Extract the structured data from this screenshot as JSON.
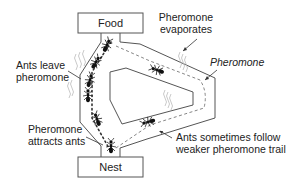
{
  "diagram": {
    "type": "ant-colony-pheromone-trail",
    "nodes": {
      "food": {
        "label": "Food"
      },
      "nest": {
        "label": "Nest"
      }
    },
    "annotations": {
      "ants_leave": [
        "Ants leave",
        "pheromone"
      ],
      "evaporates": [
        "Pheromone",
        "evaporates"
      ],
      "pheromone": "Pheromone",
      "attracts": [
        "Pheromone",
        "attracts ants"
      ],
      "sometimes": [
        "Ants sometimes follow",
        "weaker pheromone trail"
      ]
    },
    "colors": {
      "line": "#555555",
      "ant": "#111111",
      "trail_strong": "#333333",
      "trail_weak": "#777777",
      "vapor": "#bbbbbb"
    }
  }
}
